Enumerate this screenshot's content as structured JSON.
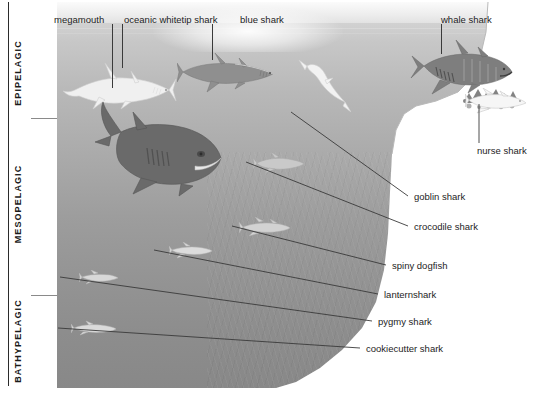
{
  "diagram": {
    "type": "cross-section illustration"
  },
  "depth_zones": [
    {
      "name": "EPIPELAGIC",
      "label": "EPIPELAGIC",
      "top": 2,
      "bottom": 118
    },
    {
      "name": "MESOPELAGIC",
      "label": "MESOPELAGIC",
      "top": 118,
      "bottom": 295
    },
    {
      "name": "BATHYPELAGIC",
      "label": "BATHYPELAGIC",
      "top": 295,
      "bottom": 388
    }
  ],
  "callouts": {
    "top": [
      {
        "label": "megamouth",
        "zone": "EPIPELAGIC"
      },
      {
        "label": "oceanic whitetip shark",
        "zone": "EPIPELAGIC"
      },
      {
        "label": "blue shark",
        "zone": "EPIPELAGIC"
      },
      {
        "label": "whale shark",
        "zone": "EPIPELAGIC"
      }
    ],
    "right": [
      {
        "label": "nurse shark",
        "zone": "EPIPELAGIC"
      },
      {
        "label": "goblin shark",
        "zone": "MESOPELAGIC"
      },
      {
        "label": "crocodile shark",
        "zone": "MESOPELAGIC"
      },
      {
        "label": "spiny dogfish",
        "zone": "MESOPELAGIC"
      },
      {
        "label": "lanternshark",
        "zone": "MESOPELAGIC"
      },
      {
        "label": "pygmy shark",
        "zone": "BATHYPELAGIC"
      },
      {
        "label": "cookiecutter shark",
        "zone": "BATHYPELAGIC"
      }
    ]
  },
  "colors": {
    "surface": "#f4f4f4",
    "shallow_water": "#c7c7c7",
    "deep_water": "#888888",
    "slope": "#ffffff",
    "text": "#1d1d1d",
    "leader_line": "#3a3a3a"
  }
}
